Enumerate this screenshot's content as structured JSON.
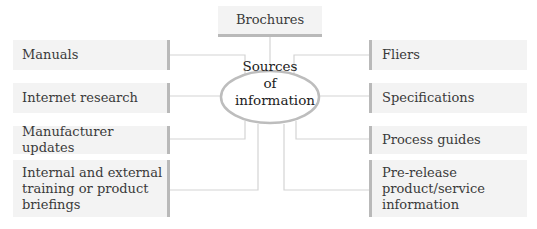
{
  "diagram": {
    "type": "mind-map",
    "center": {
      "label": "Sources of\ninformation"
    },
    "top": {
      "label": "Brochures"
    },
    "left": [
      {
        "label": "Manuals"
      },
      {
        "label": "Internet research"
      },
      {
        "label": "Manufacturer updates"
      },
      {
        "label": "Internal and external\ntraining or product\nbriefings"
      }
    ],
    "right": [
      {
        "label": "Fliers"
      },
      {
        "label": "Specifications"
      },
      {
        "label": "Process guides"
      },
      {
        "label": "Pre-release\nproduct/service\ninformation"
      }
    ],
    "colors": {
      "box_fill": "#f3f3f3",
      "box_accent": "#b9b9b9",
      "connector": "#d4d4d4",
      "ellipse_stroke": "#bdbdbd"
    }
  }
}
